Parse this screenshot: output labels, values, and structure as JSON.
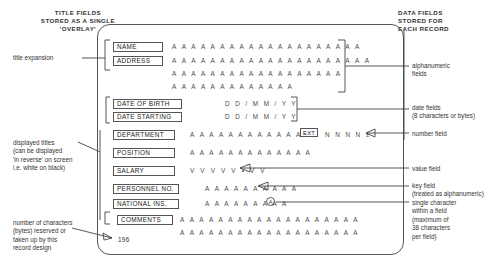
{
  "headers": {
    "left": "TITLE FIELDS\nSTORED AS A SINGLE\n'OVERLAY'",
    "right": "DATA FIELDS\nSTORED FOR\nEACH RECORD"
  },
  "annotations": {
    "title_expansion": "title expansion",
    "displayed_titles": "displayed titles\n(can be displayed\n'in reverse' on screen\ni.e. white on black)",
    "byte_count_note": "number of characters\n(bytes) reserved or\ntaken up by this\nrecord design",
    "alphanumeric_fields": "alphanumeric\nfields",
    "date_fields": "date fields\n(8 characters or bytes)",
    "number_field": "number field",
    "value_field": "value field",
    "key_field": "key field\n(treated as alphanumeric)",
    "single_character": "single character\nwithin a field\n(maximum of\n38 characters\nper field)"
  },
  "record": {
    "byte_count": "196",
    "ext_label": "EXT",
    "circled_char": "A",
    "fields": [
      {
        "label": "NAME",
        "data": "A A A A A A A A A A A A A A A A A A A A"
      },
      {
        "label": "ADDRESS",
        "data": "A A A A A A A A A A A A A A A A A A A A A"
      },
      {
        "label": "",
        "data": "A A A A A A A A A A A A A A A A A A"
      },
      {
        "label": "",
        "data": "A A A A A A A A A A A A A"
      },
      {
        "label": "DATE OF BIRTH",
        "data": "D D / M M / Y Y"
      },
      {
        "label": "DATE STARTING",
        "data": "D D / M M / Y Y"
      },
      {
        "label": "DEPARTMENT",
        "data": "A A A A A A A A A A A A A"
      },
      {
        "label": "POSITION",
        "data": "A A A A A A A A A A A A A"
      },
      {
        "label": "SALARY",
        "data": "V V V V V • V V"
      },
      {
        "label": "PERSONNEL NO.",
        "data": "A A A A A A A A A A"
      },
      {
        "label": "NATIONAL INS.",
        "data": "A A A A A A A A A"
      },
      {
        "label": "COMMENTS",
        "data": "A A A A A A A A A A A A A A A A A A A"
      },
      {
        "label": "",
        "data": "A A A A A A A A A A A A A A A A A A A"
      }
    ],
    "number_field_data": "N N N N ±"
  }
}
